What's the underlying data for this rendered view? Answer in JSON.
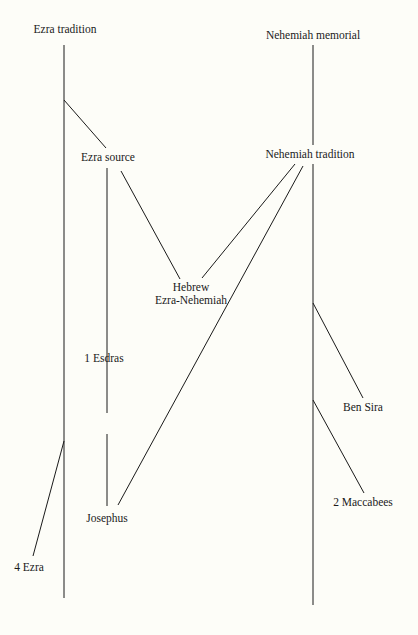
{
  "nodes": {
    "ezra_tradition": "Ezra tradition",
    "nehemiah_memorial": "Nehemiah memorial",
    "ezra_source": "Ezra source",
    "nehemiah_tradition": "Nehemiah tradition",
    "hebrew_line1": "Hebrew",
    "hebrew_line2": "Ezra-Nehemiah",
    "esdras": "1 Esdras",
    "ben_sira": "Ben Sira",
    "josephus": "Josephus",
    "maccabees": "2 Maccabees",
    "ezra4": "4 Ezra"
  },
  "colors": {
    "line": "#1a1a1a",
    "background": "#fdfdf8"
  }
}
